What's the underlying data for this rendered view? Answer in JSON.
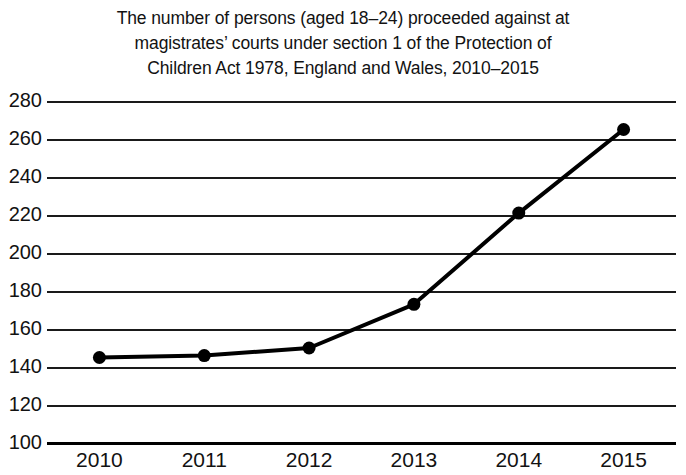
{
  "chart_data": {
    "type": "line",
    "title": "The number of persons (aged 18–24) proceeded against at magistrates’ courts under section 1 of the Protection of Children Act 1978, England and Wales, 2010–2015",
    "title_lines": [
      "The number of persons (aged 18–24) proceeded against at",
      "magistrates’ courts under section 1 of the Protection of",
      "Children Act 1978, England and Wales, 2010–2015"
    ],
    "subtitle": "",
    "xlabel": "",
    "ylabel": "",
    "categories": [
      "2010",
      "2011",
      "2012",
      "2013",
      "2014",
      "2015"
    ],
    "x": [
      2010,
      2011,
      2012,
      2013,
      2014,
      2015
    ],
    "values": [
      145,
      146,
      150,
      173,
      221,
      265
    ],
    "series": [
      {
        "name": "Persons aged 18–24 proceeded against",
        "values": [
          145,
          146,
          150,
          173,
          221,
          265
        ]
      }
    ],
    "ylim": [
      100,
      280
    ],
    "ytick_values": [
      280,
      260,
      240,
      220,
      200,
      180,
      160,
      140,
      120,
      100
    ],
    "ytick_labels": [
      "280",
      "260",
      "240",
      "220",
      "200",
      "180",
      "160",
      "140",
      "120",
      "100"
    ],
    "ytick_step": 20,
    "xtick_labels": [
      "2010",
      "2011",
      "2012",
      "2013",
      "2014",
      "2015"
    ],
    "grid": "horizontal",
    "legend": "none",
    "annotations": [],
    "colors": {
      "line": "#000000",
      "marker": "#000000",
      "grid": "#1a1a1a",
      "axis": "#000000",
      "background": "#ffffff",
      "text": "#121212"
    },
    "marker": "circle",
    "line_width": 4
  }
}
